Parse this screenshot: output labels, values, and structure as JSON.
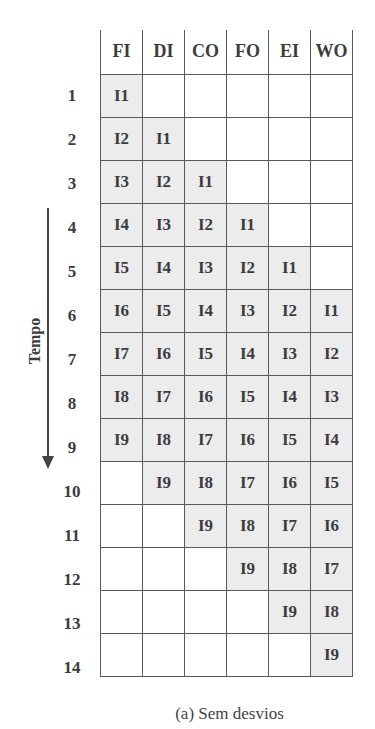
{
  "columns": [
    "FI",
    "DI",
    "CO",
    "FO",
    "EI",
    "WO"
  ],
  "rows": [
    {
      "num": "1",
      "cells": [
        "I1",
        "",
        "",
        "",
        "",
        ""
      ]
    },
    {
      "num": "2",
      "cells": [
        "I2",
        "I1",
        "",
        "",
        "",
        ""
      ]
    },
    {
      "num": "3",
      "cells": [
        "I3",
        "I2",
        "I1",
        "",
        "",
        ""
      ]
    },
    {
      "num": "4",
      "cells": [
        "I4",
        "I3",
        "I2",
        "I1",
        "",
        ""
      ]
    },
    {
      "num": "5",
      "cells": [
        "I5",
        "I4",
        "I3",
        "I2",
        "I1",
        ""
      ]
    },
    {
      "num": "6",
      "cells": [
        "I6",
        "I5",
        "I4",
        "I3",
        "I2",
        "I1"
      ]
    },
    {
      "num": "7",
      "cells": [
        "I7",
        "I6",
        "I5",
        "I4",
        "I3",
        "I2"
      ]
    },
    {
      "num": "8",
      "cells": [
        "I8",
        "I7",
        "I6",
        "I5",
        "I4",
        "I3"
      ]
    },
    {
      "num": "9",
      "cells": [
        "I9",
        "I8",
        "I7",
        "I6",
        "I5",
        "I4"
      ]
    },
    {
      "num": "10",
      "cells": [
        "",
        "I9",
        "I8",
        "I7",
        "I6",
        "I5"
      ]
    },
    {
      "num": "11",
      "cells": [
        "",
        "",
        "I9",
        "I8",
        "I7",
        "I6"
      ]
    },
    {
      "num": "12",
      "cells": [
        "",
        "",
        "",
        "I9",
        "I8",
        "I7"
      ]
    },
    {
      "num": "13",
      "cells": [
        "",
        "",
        "",
        "",
        "I9",
        "I8"
      ]
    },
    {
      "num": "14",
      "cells": [
        "",
        "",
        "",
        "",
        "",
        "I9"
      ]
    }
  ],
  "axis_label": "Tempo",
  "caption": "(a) Sem desvios",
  "colors": {
    "filled_cell": "#ececec",
    "grid_line": "#5a5a5a",
    "text": "#3c3c3c"
  }
}
